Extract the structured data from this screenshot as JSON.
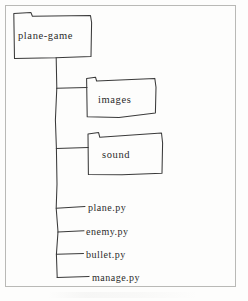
{
  "diagram": {
    "type": "file-tree",
    "style": "hand-drawn sketch",
    "frame": {
      "present": true,
      "color": "#b9b9b6"
    },
    "stroke_color": "#3a3a3a",
    "text_color": "#2b2b2b",
    "background_color": "#fdfdfc",
    "root": {
      "kind": "folder",
      "label": "plane-game",
      "icon": "folder-icon"
    },
    "folders": [
      {
        "kind": "folder",
        "label": "images",
        "icon": "folder-icon"
      },
      {
        "kind": "folder",
        "label": "sound",
        "icon": "folder-icon"
      }
    ],
    "files": [
      {
        "kind": "file",
        "label": "plane.py"
      },
      {
        "kind": "file",
        "label": "enemy.py"
      },
      {
        "kind": "file",
        "label": "bullet.py"
      },
      {
        "kind": "file",
        "label": "manage.py"
      }
    ]
  }
}
